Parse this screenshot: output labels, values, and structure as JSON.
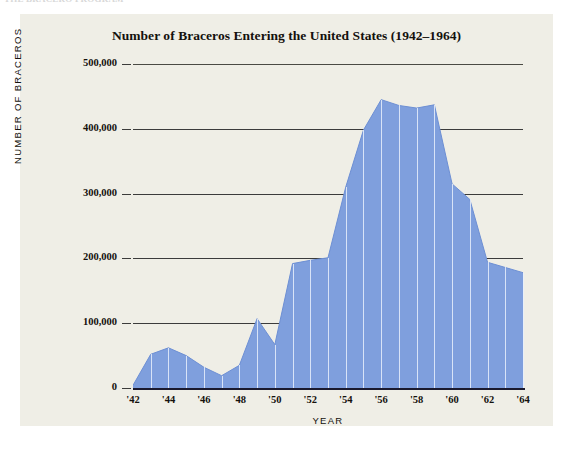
{
  "page": {
    "ghost_caption": "THE BRACERO PROGRAM"
  },
  "figure": {
    "title": "Number of Braceros Entering the United States (1942–1964)",
    "background_color": "#efeee6",
    "series_color": "#7f9fdd",
    "series_stroke_color": "#6d8fd4",
    "axis_color": "#1a1a2e",
    "gridline_color": "#3b3b3b",
    "text_color": "#14110d"
  },
  "axes": {
    "y": {
      "title": "NUMBER OF BRACEROS",
      "ticks": [
        "0",
        "100,000",
        "200,000",
        "300,000",
        "400,000",
        "500,000"
      ],
      "tick_values": [
        0,
        100000,
        200000,
        300000,
        400000,
        500000
      ],
      "min": 0,
      "max": 500000
    },
    "x": {
      "title": "YEAR",
      "ticks": [
        "'42",
        "'44",
        "'46",
        "'48",
        "'50",
        "'52",
        "'54",
        "'56",
        "'58",
        "'60",
        "'62",
        "'64"
      ],
      "tick_values": [
        1942,
        1944,
        1946,
        1948,
        1950,
        1952,
        1954,
        1956,
        1958,
        1960,
        1962,
        1964
      ],
      "min": 1942,
      "max": 1964
    }
  },
  "chart_data": {
    "type": "area",
    "title": "Number of Braceros Entering the United States (1942–1964)",
    "xlabel": "YEAR",
    "ylabel": "NUMBER OF BRACEROS",
    "xlim": [
      1942,
      1964
    ],
    "ylim": [
      0,
      500000
    ],
    "grid": true,
    "legend": "none",
    "x": [
      1942,
      1943,
      1944,
      1945,
      1946,
      1947,
      1948,
      1949,
      1950,
      1951,
      1952,
      1953,
      1954,
      1955,
      1956,
      1957,
      1958,
      1959,
      1960,
      1961,
      1962,
      1963,
      1964
    ],
    "categories": [
      "1942",
      "1943",
      "1944",
      "1945",
      "1946",
      "1947",
      "1948",
      "1949",
      "1950",
      "1951",
      "1952",
      "1953",
      "1954",
      "1955",
      "1956",
      "1957",
      "1958",
      "1959",
      "1960",
      "1961",
      "1962",
      "1963",
      "1964"
    ],
    "values": [
      4200,
      52000,
      62000,
      50000,
      32000,
      19000,
      35000,
      107000,
      67000,
      192000,
      197000,
      201000,
      310000,
      398000,
      445000,
      436000,
      432000,
      437000,
      315000,
      291000,
      194000,
      186000,
      178000
    ],
    "series": [
      {
        "name": "Braceros entering the United States",
        "values": [
          4200,
          52000,
          62000,
          50000,
          32000,
          19000,
          35000,
          107000,
          67000,
          192000,
          197000,
          201000,
          310000,
          398000,
          445000,
          436000,
          432000,
          437000,
          315000,
          291000,
          194000,
          186000,
          178000
        ]
      }
    ],
    "annotations": []
  }
}
